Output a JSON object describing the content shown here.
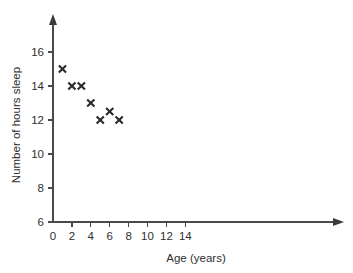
{
  "chart_data": {
    "type": "scatter",
    "title": "",
    "xlabel": "Age (years)",
    "ylabel": "Number of hours sleep",
    "xlim": [
      0,
      15
    ],
    "ylim": [
      6,
      16.6
    ],
    "xticks": [
      0,
      2,
      4,
      6,
      8,
      10,
      12,
      14
    ],
    "yticks": [
      6,
      8,
      10,
      12,
      14,
      16
    ],
    "xtick_labels": [
      "0",
      "2",
      "4",
      "6",
      "8",
      "10",
      "12",
      "14"
    ],
    "ytick_labels": [
      "6",
      "8",
      "10",
      "12",
      "14",
      "16"
    ],
    "grid": false,
    "legend": null,
    "marker": "x",
    "marker_color": "#2b2b2b",
    "axis_color": "#4a4a4a",
    "background": "#ffffff",
    "x": [
      1,
      2,
      3,
      4,
      5,
      6,
      7
    ],
    "y": [
      15,
      14,
      14,
      13,
      12,
      12.5,
      12
    ],
    "points": [
      {
        "age": 1,
        "hours": 15
      },
      {
        "age": 2,
        "hours": 14
      },
      {
        "age": 3,
        "hours": 14
      },
      {
        "age": 4,
        "hours": 13
      },
      {
        "age": 5,
        "hours": 12
      },
      {
        "age": 6,
        "hours": 12.5
      },
      {
        "age": 7,
        "hours": 12
      }
    ]
  }
}
